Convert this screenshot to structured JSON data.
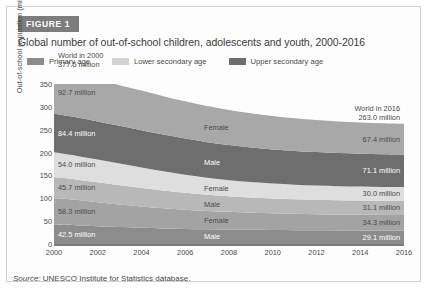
{
  "figure": {
    "badge": "FIGURE 1",
    "title": "Global number of out-of-school children, adolescents and youth, 2000-2016",
    "source_prefix": "Source:",
    "source_text": "UNESCO Institute for Statistics database."
  },
  "legend": {
    "items": [
      {
        "label": "Primary age",
        "color": "#8c8c8c"
      },
      {
        "label": "Lower secondary age",
        "color": "#d2d2d2"
      },
      {
        "label": "Upper secondary age",
        "color": "#6e6e6e"
      }
    ]
  },
  "annotations": {
    "start": {
      "line1": "World in 2000",
      "line2": "377.5 million"
    },
    "end": {
      "line1": "World in 2016",
      "line2": "263.0 million"
    }
  },
  "chart_data": {
    "type": "area",
    "title": "Global number of out-of-school children, adolescents and youth, 2000-2016",
    "xlabel": "",
    "ylabel": "Out-of-school population (million)",
    "xlim": [
      2000,
      2016
    ],
    "ylim": [
      0,
      350
    ],
    "yticks": [
      0,
      50,
      100,
      150,
      200,
      250,
      300,
      350
    ],
    "xticks": [
      2000,
      2002,
      2004,
      2006,
      2008,
      2010,
      2012,
      2014,
      2016
    ],
    "grid": false,
    "stacked": true,
    "legend_position": "top",
    "x": [
      2000,
      2001,
      2002,
      2003,
      2004,
      2005,
      2006,
      2007,
      2008,
      2009,
      2010,
      2011,
      2012,
      2013,
      2014,
      2015,
      2016
    ],
    "series": [
      {
        "name": "Primary age Male",
        "group": "Primary age",
        "sex": "Male",
        "color": "#8c8c8c",
        "in_plot_label": "Male",
        "start_label": "42.5 million",
        "end_label": "29.1 million",
        "values": [
          42.5,
          41.0,
          39.0,
          37.0,
          35.5,
          34.0,
          33.0,
          32.2,
          31.6,
          31.0,
          30.6,
          30.2,
          29.9,
          29.6,
          29.4,
          29.2,
          29.1
        ]
      },
      {
        "name": "Primary age Female",
        "group": "Primary age",
        "sex": "Female",
        "color": "#a3a3a3",
        "in_plot_label": "Female",
        "start_label": "58.3 million",
        "end_label": "34.3 million",
        "values": [
          58.3,
          55.6,
          52.5,
          49.5,
          46.8,
          44.2,
          42.0,
          40.2,
          38.8,
          37.6,
          36.6,
          35.9,
          35.3,
          34.9,
          34.6,
          34.4,
          34.3
        ]
      },
      {
        "name": "Lower secondary age Male",
        "group": "Lower secondary age",
        "sex": "Male",
        "color": "#b8b8b8",
        "in_plot_label": "Male",
        "start_label": "45.7 million",
        "end_label": "31.1 million",
        "values": [
          45.7,
          44.6,
          43.4,
          42.0,
          40.4,
          38.7,
          37.0,
          35.4,
          34.1,
          33.1,
          32.4,
          31.9,
          31.6,
          31.4,
          31.3,
          31.2,
          31.1
        ]
      },
      {
        "name": "Lower secondary age Female",
        "group": "Lower secondary age",
        "sex": "Female",
        "color": "#dedede",
        "in_plot_label": "Female",
        "start_label": "54.0 million",
        "end_label": "30.0 million",
        "values": [
          54.0,
          52.0,
          49.8,
          47.4,
          44.8,
          42.0,
          39.4,
          37.0,
          35.2,
          33.8,
          32.7,
          31.8,
          31.2,
          30.7,
          30.4,
          30.1,
          30.0
        ]
      },
      {
        "name": "Upper secondary age Male",
        "group": "Upper secondary age",
        "sex": "Male",
        "color": "#6e6e6e",
        "in_plot_label": "Male",
        "start_label": "84.4 million",
        "end_label": "71.1 million",
        "values": [
          84.4,
          84.0,
          83.4,
          82.6,
          81.6,
          80.4,
          79.2,
          78.0,
          76.8,
          75.6,
          74.6,
          73.8,
          73.0,
          72.4,
          71.9,
          71.5,
          71.1
        ]
      },
      {
        "name": "Upper secondary age Female",
        "group": "Upper secondary age",
        "sex": "Female",
        "color": "#a8a8a8",
        "in_plot_label": "Female",
        "start_label": "92.7 million",
        "end_label": "67.4 million",
        "values": [
          92.7,
          92.0,
          90.8,
          89.0,
          86.6,
          84.0,
          81.4,
          79.0,
          76.8,
          74.8,
          73.0,
          71.4,
          70.1,
          69.1,
          68.3,
          67.8,
          67.4
        ]
      }
    ],
    "totals": {
      "2000": 377.5,
      "2016": 263.0
    }
  }
}
